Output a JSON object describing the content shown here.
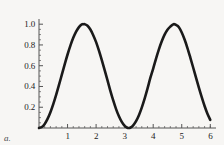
{
  "figure": {
    "panel_label": "a.",
    "background_color": "#f7f6f4",
    "curve_color": "#1a1a1a",
    "axis_color": "#555555"
  },
  "chart_data": {
    "type": "line",
    "title": "",
    "xlabel": "",
    "ylabel": "",
    "function": "sin^2(x)",
    "xlim": [
      0,
      6.2
    ],
    "ylim": [
      0,
      1.05
    ],
    "grid": false,
    "legend": null,
    "xticks": [
      1,
      2,
      3,
      4,
      5,
      6
    ],
    "xtick_labels": [
      "1",
      "2",
      "3",
      "4",
      "5",
      "6"
    ],
    "yticks": [
      0.2,
      0.4,
      0.6,
      0.8,
      1.0
    ],
    "ytick_labels": [
      "0.2",
      "0.4",
      "0.6",
      "0.8",
      "1.0"
    ],
    "minor_xticks": [
      0.2,
      0.4,
      0.6,
      0.8,
      1.2,
      1.4,
      1.6,
      1.8,
      2.2,
      2.4,
      2.6,
      2.8,
      3.2,
      3.4,
      3.6,
      3.8,
      4.2,
      4.4,
      4.6,
      4.8,
      5.2,
      5.4,
      5.6,
      5.8,
      6.0
    ],
    "minor_yticks": [
      0.05,
      0.1,
      0.15,
      0.25,
      0.3,
      0.35,
      0.45,
      0.5,
      0.55,
      0.65,
      0.7,
      0.75,
      0.85,
      0.9,
      0.95
    ],
    "x": [
      0.0,
      0.1,
      0.2,
      0.3,
      0.4,
      0.5,
      0.6,
      0.7,
      0.8,
      0.9,
      1.0,
      1.1,
      1.2,
      1.3,
      1.4,
      1.5,
      1.5708,
      1.6,
      1.7,
      1.8,
      1.9,
      2.0,
      2.1,
      2.2,
      2.3,
      2.4,
      2.5,
      2.6,
      2.7,
      2.8,
      2.9,
      3.0,
      3.1,
      3.1416,
      3.2,
      3.3,
      3.4,
      3.5,
      3.6,
      3.7,
      3.8,
      3.9,
      4.0,
      4.1,
      4.2,
      4.3,
      4.4,
      4.5,
      4.6,
      4.7124,
      4.8,
      4.9,
      5.0,
      5.1,
      5.2,
      5.3,
      5.4,
      5.5,
      5.6,
      5.7,
      5.8,
      5.9,
      6.0
    ],
    "y": [
      0.0,
      0.00997,
      0.03947,
      0.08733,
      0.15165,
      0.22985,
      0.31876,
      0.41471,
      0.5138,
      0.61209,
      0.70807,
      0.79383,
      0.86828,
      0.92837,
      0.972,
      0.99749,
      1.0,
      0.99957,
      0.98464,
      0.94898,
      0.89414,
      0.82682,
      0.74498,
      0.65387,
      0.55724,
      0.45907,
      0.35822,
      0.2657,
      0.18211,
      0.11291,
      0.05836,
      0.01991,
      0.00172,
      0.0,
      0.00339,
      0.02623,
      0.06594,
      0.12318,
      0.19614,
      0.28258,
      0.37921,
      0.482,
      0.57275,
      0.66852,
      0.75742,
      0.83511,
      0.89902,
      0.94629,
      0.97634,
      1.0,
      0.99237,
      0.97113,
      0.91953,
      0.85227,
      0.77028,
      0.67907,
      0.58272,
      0.4847,
      0.38839,
      0.2967,
      0.2123,
      0.13752,
      0.07807
    ]
  }
}
